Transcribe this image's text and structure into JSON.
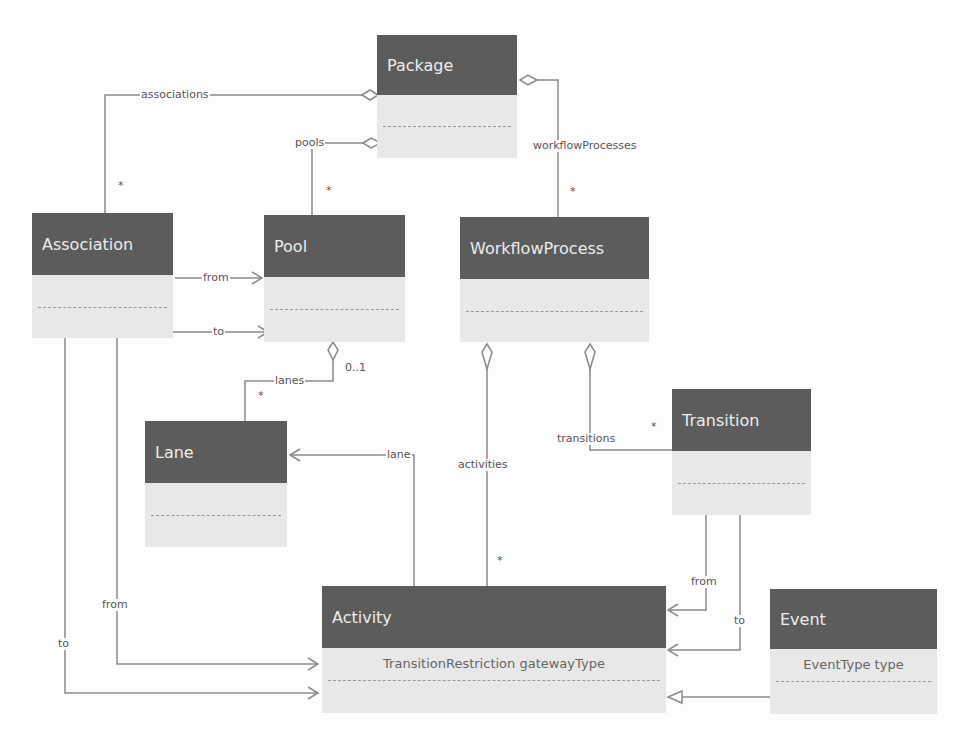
{
  "diagram": {
    "type": "uml-class-diagram",
    "colors": {
      "header_bg": "#5c5c5c",
      "header_text": "#ececec",
      "body_bg": "#e8e8e8",
      "line": "#8a8a8a"
    },
    "classes": {
      "package": {
        "name": "Package",
        "attributes": []
      },
      "association": {
        "name": "Association",
        "attributes": []
      },
      "pool": {
        "name": "Pool",
        "attributes": []
      },
      "workflow_process": {
        "name": "WorkflowProcess",
        "attributes": []
      },
      "lane": {
        "name": "Lane",
        "attributes": []
      },
      "transition": {
        "name": "Transition",
        "attributes": []
      },
      "activity": {
        "name": "Activity",
        "attributes": [
          "TransitionRestriction gatewayType"
        ]
      },
      "event": {
        "name": "Event",
        "attributes": [
          "EventType type"
        ]
      }
    },
    "relations": {
      "associations": {
        "label": "associations",
        "multiplicity": "*"
      },
      "pools": {
        "label": "pools",
        "multiplicity": "*"
      },
      "workflow_processes": {
        "label": "workflowProcesses",
        "multiplicity": "*"
      },
      "assoc_from_pool": {
        "label": "from"
      },
      "assoc_to_pool": {
        "label": "to"
      },
      "lanes": {
        "label": "lanes",
        "multiplicity": "*",
        "owner_multiplicity": "0..1"
      },
      "activities": {
        "label": "activities",
        "multiplicity": "*"
      },
      "transitions": {
        "label": "transitions",
        "multiplicity": "*"
      },
      "activity_lane": {
        "label": "lane"
      },
      "transition_from": {
        "label": "from"
      },
      "transition_to": {
        "label": "to"
      },
      "assoc_from_activity": {
        "label": "from"
      },
      "assoc_to_activity": {
        "label": "to"
      }
    }
  }
}
